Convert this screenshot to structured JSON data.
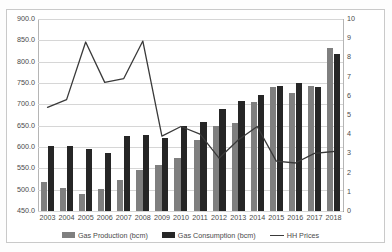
{
  "chart_data": {
    "type": "bar",
    "title": "",
    "subtitle": "",
    "xlabel": "",
    "ylabel": "",
    "y2label": "",
    "grid": true,
    "legend_position": "bottom",
    "categories": [
      "2003",
      "2004",
      "2005",
      "2006",
      "2007",
      "2008",
      "2009",
      "2010",
      "2011",
      "2012",
      "2013",
      "2014",
      "2015",
      "2016",
      "2017",
      "2018"
    ],
    "ylim": [
      450.0,
      900.0
    ],
    "ytick_labels": [
      "900.0",
      "850.0",
      "800.0",
      "750.0",
      "700.0",
      "650.0",
      "600.0",
      "550.0",
      "500.0",
      "450.0"
    ],
    "yticks": [
      900.0,
      850.0,
      800.0,
      750.0,
      700.0,
      650.0,
      600.0,
      550.0,
      500.0,
      450.0
    ],
    "y2lim": [
      0,
      10
    ],
    "y2tick_labels": [
      "10",
      "9",
      "8",
      "7",
      "6",
      "5",
      "4",
      "3",
      "2",
      "1",
      "0"
    ],
    "y2ticks": [
      10,
      9,
      8,
      7,
      6,
      5,
      4,
      3,
      2,
      1,
      0
    ],
    "series": [
      {
        "name": "Gas Production (bcm)",
        "kind": "bar",
        "axis": "left",
        "color": "#7f7f7f",
        "values": [
          518,
          503,
          490,
          501,
          522,
          545,
          558,
          575,
          617,
          650,
          656,
          705,
          740,
          727,
          744,
          832
        ]
      },
      {
        "name": "Gas Consumption (bcm)",
        "kind": "bar",
        "axis": "left",
        "color": "#262626",
        "values": [
          602,
          603,
          595,
          587,
          625,
          629,
          620,
          649,
          659,
          690,
          707,
          722,
          743,
          749,
          740,
          817
        ]
      },
      {
        "name": "HH Prices",
        "kind": "line",
        "axis": "right",
        "color": "#3a3a3a",
        "values": [
          5.4,
          5.8,
          8.8,
          6.7,
          6.9,
          8.85,
          3.9,
          4.4,
          4.0,
          2.75,
          3.7,
          4.4,
          2.6,
          2.5,
          3.0,
          3.1
        ]
      }
    ],
    "legend": [
      {
        "label": "Gas Production (bcm)",
        "marker": "bar",
        "color": "#7f7f7f"
      },
      {
        "label": "Gas Consumption (bcm)",
        "marker": "bar",
        "color": "#262626"
      },
      {
        "label": "HH Prices",
        "marker": "line",
        "color": "#3a3a3a"
      }
    ]
  }
}
